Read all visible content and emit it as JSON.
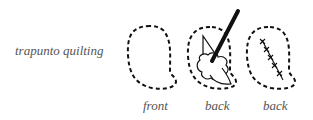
{
  "title": "trapunto quilting",
  "panels": [
    {
      "caption": "front",
      "content": "empty dashed outline"
    },
    {
      "caption": "back",
      "content": "outline with stuffing inserted by stick"
    },
    {
      "caption": "back",
      "content": "outline with cross-stitched slit"
    }
  ],
  "colors": {
    "ink": "#111111",
    "text": "#555555"
  }
}
